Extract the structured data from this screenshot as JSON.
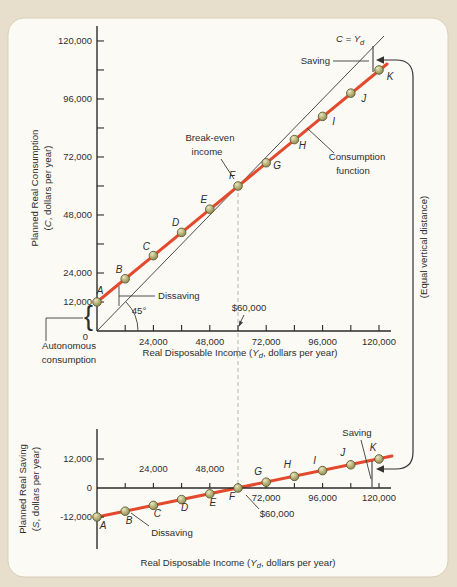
{
  "palette": {
    "page_bg": "#e7dfcc",
    "card_bg": "#fcfaf5",
    "card_border": "#d8cfba",
    "line_red": "#e2492d",
    "dot_fill": "#bcb87e",
    "dot_edge": "#5f5c33",
    "axis_color": "#2b2b2b",
    "dashed_gray": "#b5b5b5"
  },
  "chart_data": [
    {
      "id": "consumption-function-graph",
      "type": "line",
      "title": "",
      "x": [
        0,
        12000,
        24000,
        36000,
        48000,
        60000,
        72000,
        84000,
        96000,
        108000,
        120000
      ],
      "point_labels": [
        "A",
        "B",
        "C",
        "D",
        "E",
        "F",
        "G",
        "H",
        "I",
        "J",
        "K"
      ],
      "series": [
        {
          "name": "Consumption function",
          "color": "#e2492d",
          "values": [
            12000,
            21600,
            31200,
            40800,
            50400,
            60000,
            69600,
            79200,
            88800,
            98400,
            108000
          ]
        },
        {
          "name": "45-degree line (C = Yd)",
          "color": "#4a4a4a",
          "values": [
            0,
            12000,
            24000,
            36000,
            48000,
            60000,
            72000,
            84000,
            96000,
            108000,
            120000
          ]
        }
      ],
      "xlim": [
        0,
        125000
      ],
      "ylim": [
        0,
        128000
      ],
      "break_even_income": 60000,
      "autonomous_consumption": 12000,
      "x_ticks": [
        {
          "v": 12000
        },
        {
          "v": 24000,
          "label": "24,000"
        },
        {
          "v": 36000
        },
        {
          "v": 48000,
          "label": "48,000"
        },
        {
          "v": 60000
        },
        {
          "v": 72000,
          "label": "72,000"
        },
        {
          "v": 84000
        },
        {
          "v": 96000,
          "label": "96,000"
        },
        {
          "v": 108000
        },
        {
          "v": 120000,
          "label": "120,000"
        }
      ],
      "y_ticks": [
        {
          "v": 12000,
          "label": "12,000"
        },
        {
          "v": 24000,
          "label": "24,000"
        },
        {
          "v": 36000
        },
        {
          "v": 48000,
          "label": "48,000"
        },
        {
          "v": 60000
        },
        {
          "v": 72000,
          "label": "72,000"
        },
        {
          "v": 84000
        },
        {
          "v": 96000,
          "label": "96,000"
        },
        {
          "v": 108000
        },
        {
          "v": 120000,
          "label": "120,000"
        }
      ]
    },
    {
      "id": "saving-function-graph",
      "type": "line",
      "title": "",
      "x": [
        0,
        12000,
        24000,
        36000,
        48000,
        60000,
        72000,
        84000,
        96000,
        108000,
        120000
      ],
      "point_labels": [
        "A",
        "B",
        "C",
        "D",
        "E",
        "F",
        "G",
        "H",
        "I",
        "J",
        "K"
      ],
      "series": [
        {
          "name": "Saving function",
          "color": "#e2492d",
          "values": [
            -12000,
            -9600,
            -7200,
            -4800,
            -2400,
            0,
            2400,
            4800,
            7200,
            9600,
            12000
          ]
        }
      ],
      "xlim": [
        0,
        125000
      ],
      "ylim": [
        -16000,
        20000
      ],
      "break_even_income": 60000,
      "x_ticks": [
        {
          "v": 12000
        },
        {
          "v": 24000,
          "label": "24,000",
          "side": "above"
        },
        {
          "v": 36000
        },
        {
          "v": 48000,
          "label": "48,000",
          "side": "above"
        },
        {
          "v": 60000
        },
        {
          "v": 72000,
          "label": "72,000",
          "side": "below"
        },
        {
          "v": 84000
        },
        {
          "v": 96000,
          "label": "96,000",
          "side": "below"
        },
        {
          "v": 108000
        },
        {
          "v": 120000,
          "label": "120,000",
          "side": "below"
        }
      ],
      "y_ticks": [
        {
          "v": 12000,
          "label": "12,000"
        },
        {
          "v": 0,
          "label": "0"
        },
        {
          "v": -12000,
          "label": "-12,000"
        }
      ]
    }
  ],
  "axes": {
    "y_top": {
      "line1": "Planned Real Consumption",
      "line2_pre": "(",
      "line2_var": "C",
      "line2_post": ", dollars per year)"
    },
    "y_bottom": {
      "line1": "Planned Real Saving",
      "line2_pre": "(",
      "line2_var": "S",
      "line2_post": ", dollars per year)"
    },
    "x": {
      "pre": "Real Disposable Income (",
      "var": "Y",
      "sub": "d",
      "post": ", dollars per year)"
    }
  },
  "annotations": {
    "c_eq_pre": "C = Y",
    "c_eq_sub": "d",
    "saving": "Saving",
    "dissaving": "Dissaving",
    "break_even_1": "Break-even",
    "break_even_2": "income",
    "consumption_fn_1": "Consumption",
    "consumption_fn_2": "function",
    "autonomous_1": "Autonomous",
    "autonomous_2": "consumption",
    "angle_45": "45°",
    "sixty_k": "$60,000",
    "equal_vertical": "(Equal vertical distance)",
    "zero": "0",
    "brace": "{"
  }
}
